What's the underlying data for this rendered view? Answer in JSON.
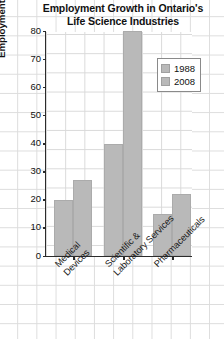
{
  "chart_data": {
    "type": "bar",
    "title": "Employment Growth in Ontario's Life Science Industries",
    "title_lines": [
      "Employment Growth in Ontario's",
      "Life Science Industries"
    ],
    "xlabel": "",
    "ylabel": "Employment (1000s)",
    "ylim": [
      0,
      80
    ],
    "ytick_step": 10,
    "yticks": [
      0,
      10,
      20,
      30,
      40,
      50,
      60,
      70,
      80
    ],
    "ytick_labels": [
      "0",
      "10",
      "20",
      "30",
      "40",
      "50",
      "60",
      "70",
      "80"
    ],
    "categories": [
      "Medical Devices",
      "Scientific & Laboratory Services",
      "Pharmaceuticals"
    ],
    "category_lines": [
      [
        "Medical",
        "Devices"
      ],
      [
        "Scientific &",
        "Laboratory Services"
      ],
      [
        "Pharmaceuticals"
      ]
    ],
    "series": [
      {
        "name": "1988",
        "values": [
          20,
          40,
          15
        ],
        "color": "#b9b9b9"
      },
      {
        "name": "2008",
        "values": [
          27,
          80,
          22
        ],
        "color": "#b9b9b9"
      }
    ],
    "legend": {
      "position": "upper-right",
      "entries": [
        {
          "label": "1988",
          "color": "#b9b9b9"
        },
        {
          "label": "2008",
          "color": "#b9b9b9"
        }
      ]
    },
    "grid": true,
    "grid_color": "#d9d9d9",
    "axis_color": "#2b2b2b",
    "background": "#ffffff",
    "background_grid": true
  }
}
